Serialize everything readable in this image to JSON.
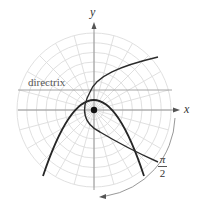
{
  "diagram": {
    "title": "",
    "labels": {
      "y_axis": "y",
      "x_axis": "x",
      "directrix": "directrix",
      "angle_numerator": "π",
      "angle_denominator": "2"
    },
    "elements": {
      "polar_grid": {
        "rings": 8,
        "spoke_spacing_deg": 15
      },
      "pole_marker": "focus point at origin",
      "curves": [
        {
          "name": "original parabola",
          "description": "opens downward, vertex above pole"
        },
        {
          "name": "rotated parabola",
          "description": "rotated by π/2, opens toward upper-right/lower-right"
        }
      ],
      "rotation_arrow": "arc arrow indicating rotation by π/2"
    },
    "colors": {
      "grid": "#d9d9d9",
      "axes": "#8c8c8c",
      "curve": "#2b2b2b",
      "pole": "#111111",
      "text": "#333333"
    }
  }
}
